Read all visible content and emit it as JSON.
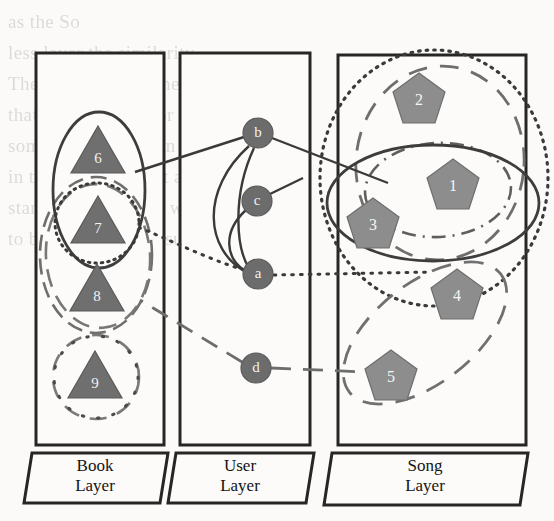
{
  "figure": {
    "type": "multilayer-network-diagram",
    "background_text_lines": [
      "as the So",
      "less layer the similarity",
      "These relations in the region of",
      "that is, if it is not for the user",
      "some probabilities in the user",
      "in the resources that are the",
      "standard items. The we can find one",
      "to be interpreted in such a way"
    ]
  },
  "colors": {
    "panel_stroke": "#262626",
    "panel_fill": "#fcfbf9",
    "triangle_fill": "#6f6f6f",
    "triangle_stroke": "#5a5a5a",
    "pentagon_fill": "#8d8d8d",
    "pentagon_stroke": "#6e6e6e",
    "circle_fill": "#6c6c6c",
    "circle_stroke": "#5a5a5a",
    "edge": "#3a3a3a",
    "community_solid": "#3d3d3d",
    "community_dashed": "#707070",
    "community_dotted": "#3d3d3d",
    "community_dashdot": "#6a6a6a",
    "label_text": "#141414",
    "node_text": "#f2f2f2"
  },
  "layers": [
    {
      "id": "book",
      "label_line1": "Book",
      "label_line2": "Layer",
      "panel": {
        "x": 36,
        "y": 53,
        "w": 128,
        "h": 392
      }
    },
    {
      "id": "user",
      "label_line1": "User",
      "label_line2": "Layer",
      "panel": {
        "x": 180,
        "y": 53,
        "w": 130,
        "h": 392
      }
    },
    {
      "id": "song",
      "label_line1": "Song",
      "label_line2": "Layer",
      "panel": {
        "x": 338,
        "y": 55,
        "w": 188,
        "h": 390
      }
    }
  ],
  "nodes": {
    "books": [
      {
        "id": "b6",
        "label": "6",
        "x": 98,
        "y": 152,
        "size": 27
      },
      {
        "id": "b7",
        "label": "7",
        "x": 98,
        "y": 222,
        "size": 27
      },
      {
        "id": "b8",
        "label": "8",
        "x": 97,
        "y": 290,
        "size": 27
      },
      {
        "id": "b9",
        "label": "9",
        "x": 95,
        "y": 377,
        "size": 27
      }
    ],
    "users": [
      {
        "id": "ub",
        "label": "b",
        "x": 258,
        "y": 133,
        "r": 15
      },
      {
        "id": "uc",
        "label": "c",
        "x": 257,
        "y": 201,
        "r": 15
      },
      {
        "id": "ua",
        "label": "a",
        "x": 258,
        "y": 274,
        "r": 15
      },
      {
        "id": "ud",
        "label": "d",
        "x": 256,
        "y": 368,
        "r": 15
      }
    ],
    "songs": [
      {
        "id": "s1",
        "label": "1",
        "x": 453,
        "y": 185,
        "size": 26
      },
      {
        "id": "s2",
        "label": "2",
        "x": 419,
        "y": 99,
        "size": 26
      },
      {
        "id": "s3",
        "label": "3",
        "x": 373,
        "y": 224,
        "size": 26
      },
      {
        "id": "s4",
        "label": "4",
        "x": 457,
        "y": 295,
        "size": 26
      },
      {
        "id": "s5",
        "label": "5",
        "x": 391,
        "y": 376,
        "size": 26
      }
    ]
  },
  "edges": [
    {
      "id": "e-b-b6",
      "from": "ub",
      "to": "b6",
      "style": "solid"
    },
    {
      "id": "e-b-s3",
      "from": "ub",
      "to": "s3",
      "style": "solid"
    },
    {
      "id": "e-b-a",
      "from": "ub",
      "to": "ua",
      "style": "solid"
    },
    {
      "id": "e-c-a",
      "from": "uc",
      "to": "ua",
      "style": "solid"
    },
    {
      "id": "e-c-s3",
      "from": "uc",
      "to": "s3",
      "style": "solid"
    },
    {
      "id": "e-a-b7",
      "from": "ua",
      "to": "b7",
      "style": "dotted"
    },
    {
      "id": "e-a-s1",
      "from": "ua",
      "to": "s1",
      "style": "dotted"
    },
    {
      "id": "e-d-b8",
      "from": "ud",
      "to": "b8",
      "style": "dashed"
    },
    {
      "id": "e-d-s5",
      "from": "ud",
      "to": "s5",
      "style": "dashed"
    }
  ],
  "communities": [
    {
      "id": "c-solid-book",
      "style": "solid",
      "layer": "book"
    },
    {
      "id": "c-solid-song",
      "style": "solid",
      "layer": "song"
    },
    {
      "id": "c-dashed-book",
      "style": "dashed",
      "layer": "book"
    },
    {
      "id": "c-dashed-song",
      "style": "dashed",
      "layer": "song"
    },
    {
      "id": "c-dashed-song2",
      "style": "dashed",
      "layer": "song"
    },
    {
      "id": "c-dotted-book",
      "style": "dotted",
      "layer": "book"
    },
    {
      "id": "c-dotted-song",
      "style": "dotted",
      "layer": "song"
    },
    {
      "id": "c-dashdot-book",
      "style": "dashdot",
      "layer": "book"
    },
    {
      "id": "c-dashdot-song",
      "style": "dashdot",
      "layer": "song"
    }
  ]
}
